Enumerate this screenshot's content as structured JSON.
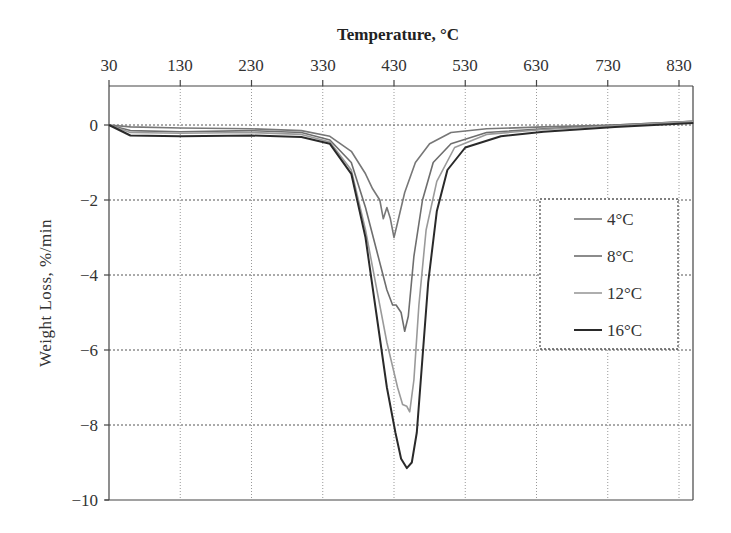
{
  "chart_data": {
    "type": "line",
    "title": "",
    "xlabel": "Temperature, °C",
    "ylabel": "Weight  Loss, %/min",
    "xlabel_position": "top",
    "x_ticks": [
      30,
      130,
      230,
      330,
      430,
      530,
      630,
      730,
      830
    ],
    "y_ticks": [
      0,
      -2,
      -4,
      -6,
      -8,
      -10
    ],
    "y_tick_labels": [
      "0",
      "−2",
      "−4",
      "−6",
      "−8",
      "−10"
    ],
    "xlim": [
      30,
      850
    ],
    "ylim": [
      -10,
      1
    ],
    "grid": true,
    "legend_position": "upper right (inside, dotted box)",
    "series": [
      {
        "name": "4°C",
        "color": "#777777",
        "width": 1.6,
        "points": [
          [
            30,
            0
          ],
          [
            60,
            -0.05
          ],
          [
            130,
            -0.08
          ],
          [
            230,
            -0.1
          ],
          [
            300,
            -0.15
          ],
          [
            340,
            -0.3
          ],
          [
            370,
            -0.7
          ],
          [
            390,
            -1.3
          ],
          [
            400,
            -1.7
          ],
          [
            410,
            -2.0
          ],
          [
            415,
            -2.5
          ],
          [
            420,
            -2.2
          ],
          [
            425,
            -2.5
          ],
          [
            430,
            -3.0
          ],
          [
            435,
            -2.6
          ],
          [
            445,
            -1.8
          ],
          [
            460,
            -1.0
          ],
          [
            480,
            -0.5
          ],
          [
            510,
            -0.2
          ],
          [
            560,
            -0.1
          ],
          [
            640,
            -0.05
          ],
          [
            740,
            0.0
          ],
          [
            850,
            0.1
          ]
        ]
      },
      {
        "name": "8°C",
        "color": "#6e6e6e",
        "width": 1.6,
        "points": [
          [
            30,
            0
          ],
          [
            60,
            -0.15
          ],
          [
            130,
            -0.18
          ],
          [
            230,
            -0.15
          ],
          [
            300,
            -0.2
          ],
          [
            340,
            -0.4
          ],
          [
            370,
            -1.0
          ],
          [
            390,
            -2.2
          ],
          [
            405,
            -3.3
          ],
          [
            420,
            -4.4
          ],
          [
            428,
            -4.8
          ],
          [
            433,
            -4.8
          ],
          [
            440,
            -5.0
          ],
          [
            445,
            -5.5
          ],
          [
            450,
            -5.1
          ],
          [
            458,
            -3.5
          ],
          [
            470,
            -2.0
          ],
          [
            485,
            -1.0
          ],
          [
            510,
            -0.5
          ],
          [
            560,
            -0.2
          ],
          [
            640,
            -0.1
          ],
          [
            740,
            0.0
          ],
          [
            850,
            0.1
          ]
        ]
      },
      {
        "name": "12°C",
        "color": "#9a9a9a",
        "width": 1.6,
        "points": [
          [
            30,
            0
          ],
          [
            60,
            -0.2
          ],
          [
            130,
            -0.22
          ],
          [
            230,
            -0.2
          ],
          [
            300,
            -0.25
          ],
          [
            340,
            -0.45
          ],
          [
            370,
            -1.2
          ],
          [
            390,
            -2.8
          ],
          [
            405,
            -4.3
          ],
          [
            420,
            -5.8
          ],
          [
            435,
            -7.0
          ],
          [
            442,
            -7.45
          ],
          [
            448,
            -7.5
          ],
          [
            452,
            -7.65
          ],
          [
            458,
            -6.8
          ],
          [
            465,
            -4.8
          ],
          [
            475,
            -2.8
          ],
          [
            490,
            -1.5
          ],
          [
            515,
            -0.6
          ],
          [
            560,
            -0.25
          ],
          [
            640,
            -0.12
          ],
          [
            740,
            -0.02
          ],
          [
            850,
            0.1
          ]
        ]
      },
      {
        "name": "16°C",
        "color": "#2a2a2a",
        "width": 2.0,
        "points": [
          [
            30,
            0
          ],
          [
            60,
            -0.28
          ],
          [
            130,
            -0.3
          ],
          [
            230,
            -0.28
          ],
          [
            300,
            -0.32
          ],
          [
            340,
            -0.5
          ],
          [
            370,
            -1.3
          ],
          [
            390,
            -3.0
          ],
          [
            405,
            -5.0
          ],
          [
            420,
            -7.0
          ],
          [
            432,
            -8.2
          ],
          [
            440,
            -8.9
          ],
          [
            448,
            -9.15
          ],
          [
            455,
            -9.0
          ],
          [
            462,
            -8.2
          ],
          [
            470,
            -6.2
          ],
          [
            478,
            -4.2
          ],
          [
            490,
            -2.3
          ],
          [
            505,
            -1.2
          ],
          [
            530,
            -0.6
          ],
          [
            580,
            -0.3
          ],
          [
            640,
            -0.18
          ],
          [
            740,
            -0.05
          ],
          [
            850,
            0.05
          ]
        ]
      }
    ]
  },
  "labels": {
    "xlabel": "Temperature, °C",
    "ylabel": "Weight  Loss, %/min",
    "x_ticks": [
      "30",
      "130",
      "230",
      "330",
      "430",
      "530",
      "630",
      "730",
      "830"
    ],
    "y_ticks": [
      "0",
      "−2",
      "−4",
      "−6",
      "−8",
      "−10"
    ],
    "legend": [
      "4°C",
      "8°C",
      "12°C",
      "16°C"
    ]
  }
}
